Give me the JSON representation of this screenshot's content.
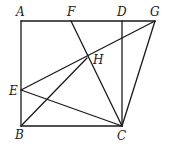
{
  "diagram": {
    "points": {
      "A": {
        "label": "A",
        "x": 21,
        "y": 21,
        "lx": 16,
        "ly": 16
      },
      "F": {
        "label": "F",
        "x": 71,
        "y": 21,
        "lx": 67,
        "ly": 16
      },
      "D": {
        "label": "D",
        "x": 122,
        "y": 21,
        "lx": 117,
        "ly": 16
      },
      "G": {
        "label": "G",
        "x": 155,
        "y": 21,
        "lx": 150,
        "ly": 16
      },
      "H": {
        "label": "H",
        "x": 87,
        "y": 58,
        "lx": 93,
        "ly": 64
      },
      "E": {
        "label": "E",
        "x": 21,
        "y": 90,
        "lx": 9,
        "ly": 95
      },
      "B": {
        "label": "B",
        "x": 21,
        "y": 126,
        "lx": 15,
        "ly": 139
      },
      "C": {
        "label": "C",
        "x": 122,
        "y": 126,
        "lx": 117,
        "ly": 140
      }
    },
    "segments": [
      [
        "A",
        "G"
      ],
      [
        "A",
        "B"
      ],
      [
        "B",
        "C"
      ],
      [
        "D",
        "C"
      ],
      [
        "F",
        "C"
      ],
      [
        "G",
        "C"
      ],
      [
        "E",
        "G"
      ],
      [
        "E",
        "C"
      ],
      [
        "B",
        "H"
      ]
    ]
  }
}
